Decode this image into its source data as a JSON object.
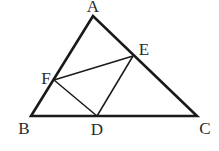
{
  "diagram": {
    "type": "geometry-triangle",
    "points": {
      "A": {
        "label": "A",
        "x": 93,
        "y": 16,
        "lx": 93,
        "ly": 12
      },
      "B": {
        "label": "B",
        "x": 31,
        "y": 116,
        "lx": 24,
        "ly": 134
      },
      "C": {
        "label": "C",
        "x": 197,
        "y": 116,
        "lx": 205,
        "ly": 134
      },
      "D": {
        "label": "D",
        "x": 97,
        "y": 116,
        "lx": 97,
        "ly": 135
      },
      "E": {
        "label": "E",
        "x": 133,
        "y": 56,
        "lx": 144,
        "ly": 55
      },
      "F": {
        "label": "F",
        "x": 54,
        "y": 80,
        "lx": 46,
        "ly": 84
      }
    },
    "outer_triangle": [
      "A",
      "B",
      "C"
    ],
    "inner_segments": [
      [
        "F",
        "E"
      ],
      [
        "F",
        "D"
      ],
      [
        "D",
        "E"
      ]
    ],
    "colors": {
      "stroke": "#1a1a1a",
      "label": "#2a2a2a",
      "background": "#ffffff"
    }
  }
}
